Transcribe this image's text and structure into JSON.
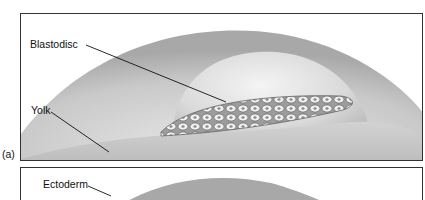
{
  "figure": {
    "panels": [
      {
        "id": "a",
        "letter": "(a)",
        "labels": {
          "blastodisc": "Blastodisc",
          "yolk": "Yolk"
        }
      },
      {
        "id": "b",
        "labels": {
          "ectoderm": "Ectoderm"
        }
      }
    ],
    "colors": {
      "frame": "#333333",
      "shell_dark": "#9a9a9a",
      "shell_light": "#d6d6d6",
      "yolk": "#c4c4c4",
      "dome": "#e6e6e6",
      "cell_fill": "#f2f2f2",
      "cell_outline": "#6e6e6e"
    }
  }
}
